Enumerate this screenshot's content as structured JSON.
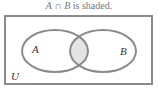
{
  "caption": {
    "set_a": "A",
    "operator": "∩",
    "set_b": "B",
    "text": "is shaded."
  },
  "diagram": {
    "universe_label": "U",
    "set_a_label": "A",
    "set_b_label": "B",
    "shaded_region": "A ∩ B",
    "colors": {
      "outline": "#8a8a8a",
      "shade": "#e4e4e4",
      "label": "#333333"
    }
  }
}
